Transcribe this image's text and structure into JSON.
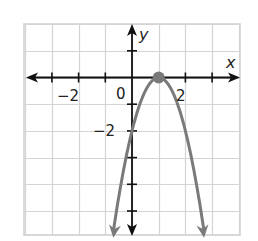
{
  "chart_data": {
    "type": "line",
    "title": "",
    "xlabel": "x",
    "ylabel": "y",
    "xlim": [
      -4,
      4
    ],
    "ylim": [
      -6,
      2
    ],
    "grid": true,
    "x_tick_labels": [
      {
        "value": -2,
        "label": "−2"
      },
      {
        "value": 0,
        "label": "0"
      },
      {
        "value": 2,
        "label": "2"
      }
    ],
    "y_tick_labels": [
      {
        "value": -2,
        "label": "−2"
      }
    ],
    "series": [
      {
        "name": "parabola",
        "equation": "y = -2(x - 1)^2",
        "color": "#7a7a7a",
        "x": [
          -0.7,
          -0.5,
          0,
          0.5,
          1,
          1.5,
          2,
          2.5,
          2.7
        ],
        "y": [
          -5.78,
          -4.5,
          -2,
          -0.5,
          0,
          -0.5,
          -2,
          -4.5,
          -5.78
        ],
        "arrows_both_ends": true
      }
    ],
    "points": [
      {
        "label": "vertex",
        "x": 1,
        "y": 0,
        "color": "#7a7a7a"
      }
    ],
    "annotations": []
  },
  "labels": {
    "x_axis": "x",
    "y_axis": "y",
    "x_neg2": "−2",
    "x_zero": "0",
    "x_pos2": "2",
    "y_neg2": "−2"
  },
  "colors": {
    "grid": "#d4d4d4",
    "axis": "#111111",
    "curve": "#7a7a7a"
  }
}
